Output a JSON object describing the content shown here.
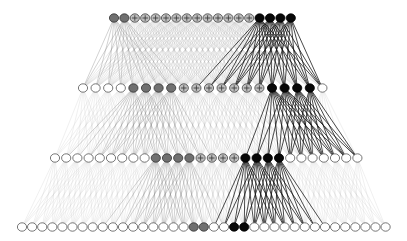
{
  "diagram": {
    "type": "layered-network",
    "width": 407,
    "height": 241,
    "node_rx": 4.6,
    "node_ry": 4.2,
    "styles": {
      "white": {
        "fill": "#ffffff",
        "stroke": "#555555",
        "edge": "#c8c8c8",
        "edge_opacity": 0.55,
        "edge_width": 0.5
      },
      "gray": {
        "fill": "#707070",
        "stroke": "#333333",
        "edge": "#808080",
        "edge_opacity": 0.6,
        "edge_width": 0.6
      },
      "crossed": {
        "fill": "#bdbdbd",
        "stroke": "#444444",
        "edge": "#a8a8a8",
        "edge_opacity": 0.5,
        "edge_width": 0.5
      },
      "black": {
        "fill": "#080808",
        "stroke": "#000000",
        "edge": "#111111",
        "edge_opacity": 0.85,
        "edge_width": 0.9
      }
    },
    "layers": [
      {
        "name": "layer-1",
        "y": 18,
        "x_start": 114,
        "spacing": 10.4,
        "window": 7,
        "nodes": [
          "gray",
          "gray",
          "crossed",
          "crossed",
          "crossed",
          "crossed",
          "crossed",
          "crossed",
          "crossed",
          "crossed",
          "crossed",
          "crossed",
          "crossed",
          "crossed",
          "black",
          "black",
          "black",
          "black"
        ]
      },
      {
        "name": "layer-2",
        "y": 88,
        "x_start": 83,
        "spacing": 12.6,
        "window": 5,
        "nodes": [
          "white",
          "white",
          "white",
          "white",
          "gray",
          "gray",
          "gray",
          "gray",
          "crossed",
          "crossed",
          "crossed",
          "crossed",
          "crossed",
          "crossed",
          "crossed",
          "black",
          "black",
          "black",
          "black",
          "white"
        ]
      },
      {
        "name": "layer-3",
        "y": 158,
        "x_start": 55,
        "spacing": 11.2,
        "window": 4,
        "nodes": [
          "white",
          "white",
          "white",
          "white",
          "white",
          "white",
          "white",
          "white",
          "white",
          "gray",
          "gray",
          "gray",
          "gray",
          "crossed",
          "crossed",
          "crossed",
          "crossed",
          "black",
          "black",
          "black",
          "black",
          "white",
          "white",
          "white",
          "white",
          "white",
          "white",
          "white"
        ]
      },
      {
        "name": "layer-4",
        "y": 227,
        "x_start": 22,
        "spacing": 10.1,
        "window": 0,
        "nodes": [
          "white",
          "white",
          "white",
          "white",
          "white",
          "white",
          "white",
          "white",
          "white",
          "white",
          "white",
          "white",
          "white",
          "white",
          "white",
          "white",
          "white",
          "gray",
          "gray",
          "white",
          "white",
          "black",
          "black",
          "white",
          "white",
          "white",
          "white",
          "white",
          "white",
          "white",
          "white",
          "white",
          "white",
          "white",
          "white",
          "white",
          "white"
        ]
      }
    ]
  }
}
